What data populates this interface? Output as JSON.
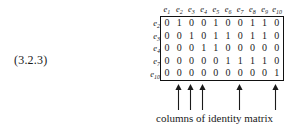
{
  "equation_number": "(3.2.3)",
  "matrix": {
    "column_headers": [
      "e1",
      "e2",
      "e3",
      "e4",
      "e5",
      "e6",
      "e7",
      "e8",
      "e9",
      "e10"
    ],
    "column_header_bases": [
      "e",
      "e",
      "e",
      "e",
      "e",
      "e",
      "e",
      "e",
      "e",
      "e"
    ],
    "column_header_subs": [
      "1",
      "2",
      "3",
      "4",
      "5",
      "6",
      "7",
      "8",
      "9",
      "10"
    ],
    "row_labels": [
      "e2",
      "e3",
      "e4",
      "e7",
      "e10"
    ],
    "row_label_bases": [
      "e",
      "e",
      "e",
      "e",
      "e"
    ],
    "row_label_subs": [
      "2",
      "3",
      "4",
      "7",
      "10"
    ],
    "rows": [
      [
        0,
        1,
        0,
        0,
        1,
        0,
        0,
        1,
        1,
        0
      ],
      [
        0,
        0,
        1,
        0,
        1,
        1,
        0,
        1,
        1,
        0
      ],
      [
        0,
        0,
        0,
        1,
        1,
        0,
        0,
        0,
        0,
        0
      ],
      [
        0,
        0,
        0,
        0,
        0,
        1,
        1,
        1,
        1,
        0
      ],
      [
        0,
        0,
        0,
        0,
        0,
        0,
        0,
        0,
        0,
        1
      ]
    ]
  },
  "annotation": {
    "arrow_columns": [
      2,
      3,
      4,
      7,
      10
    ],
    "arrow_count": 5,
    "caption": "columns of identity matrix"
  },
  "colors": {
    "background": "#ffffff",
    "ink": "#1a1a1a",
    "border": "#111111"
  }
}
